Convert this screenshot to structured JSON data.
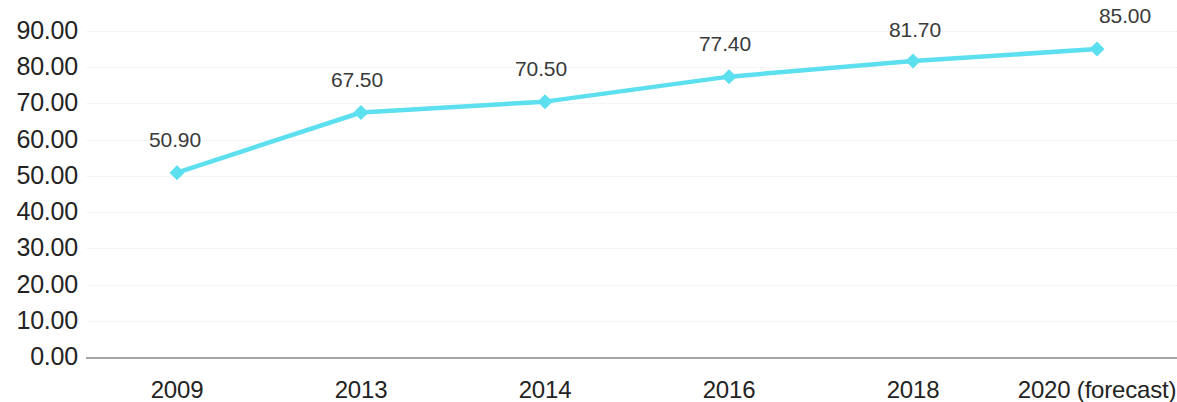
{
  "chart_data": {
    "type": "line",
    "title": "",
    "subtitle": "",
    "xlabel": "",
    "ylabel": "",
    "categories": [
      "2009",
      "2013",
      "2014",
      "2016",
      "2018",
      "2020 (forecast)"
    ],
    "values": [
      50.9,
      67.5,
      70.5,
      77.4,
      81.7,
      85.0
    ],
    "point_labels": [
      "50.90",
      "67.50",
      "70.50",
      "77.40",
      "81.70",
      "85.00"
    ],
    "series": [
      {
        "name": "",
        "values": [
          50.9,
          67.5,
          70.5,
          77.4,
          81.7,
          85.0
        ],
        "color": "#5cdfef",
        "marker": "diamond"
      }
    ],
    "ylim": [
      0,
      90
    ],
    "ytick_step": 10,
    "ytick_labels": [
      "90.00",
      "80.00",
      "70.00",
      "60.00",
      "50.00",
      "40.00",
      "30.00",
      "20.00",
      "10.00",
      "0.00"
    ],
    "ytick_values": [
      90,
      80,
      70,
      60,
      50,
      40,
      30,
      20,
      10,
      0
    ],
    "grid": true,
    "grid_style": "dotted",
    "grid_color": "#e9e9e9",
    "axis_line_color": "#a6a6a6",
    "legend": false,
    "legend_position": "none",
    "label_color": "#3a3a3a",
    "tick_color": "#232323",
    "background": "#ffffff"
  }
}
